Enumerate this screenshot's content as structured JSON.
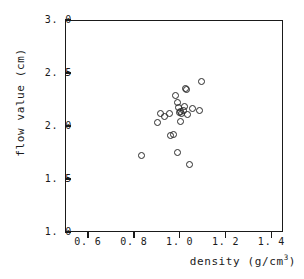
{
  "chart_data": {
    "type": "scatter",
    "title": "",
    "xlabel": "density (g/cm3)",
    "ylabel": "flow value (cm)",
    "xlabel_base": "density (g/cm",
    "xlabel_sup": "3",
    "xlabel_tail": ")",
    "xlim": [
      0.5,
      1.45
    ],
    "ylim": [
      1.0,
      3.0
    ],
    "xticks": [
      0.6,
      0.8,
      1.0,
      1.2,
      1.4
    ],
    "yticks": [
      1.0,
      1.5,
      2.0,
      2.5,
      3.0
    ],
    "xtick_labels": [
      "0. 6",
      "0. 8",
      "1. 0",
      "1. 2",
      "1. 4"
    ],
    "ytick_labels": [
      "1. 0",
      "1. 5",
      "2. 0",
      "2. 5",
      "3. 0"
    ],
    "grid": false,
    "legend": false,
    "marker": "open-circle",
    "series": [
      {
        "name": "samples",
        "points": [
          {
            "x": 0.83,
            "y": 1.73
          },
          {
            "x": 0.9,
            "y": 2.04
          },
          {
            "x": 0.91,
            "y": 2.13
          },
          {
            "x": 0.93,
            "y": 2.1
          },
          {
            "x": 0.95,
            "y": 2.13
          },
          {
            "x": 0.955,
            "y": 1.92
          },
          {
            "x": 0.97,
            "y": 1.93
          },
          {
            "x": 0.975,
            "y": 2.3
          },
          {
            "x": 0.985,
            "y": 2.23
          },
          {
            "x": 0.99,
            "y": 2.18
          },
          {
            "x": 0.995,
            "y": 2.14
          },
          {
            "x": 1.0,
            "y": 2.15
          },
          {
            "x": 1.005,
            "y": 2.13
          },
          {
            "x": 1.01,
            "y": 2.16
          },
          {
            "x": 1.0,
            "y": 2.05
          },
          {
            "x": 1.015,
            "y": 2.19
          },
          {
            "x": 1.02,
            "y": 2.36
          },
          {
            "x": 1.025,
            "y": 2.355
          },
          {
            "x": 1.03,
            "y": 2.12
          },
          {
            "x": 0.985,
            "y": 1.76
          },
          {
            "x": 1.05,
            "y": 2.17
          },
          {
            "x": 1.08,
            "y": 2.155
          },
          {
            "x": 1.09,
            "y": 2.43
          },
          {
            "x": 1.04,
            "y": 1.65
          }
        ]
      }
    ]
  }
}
